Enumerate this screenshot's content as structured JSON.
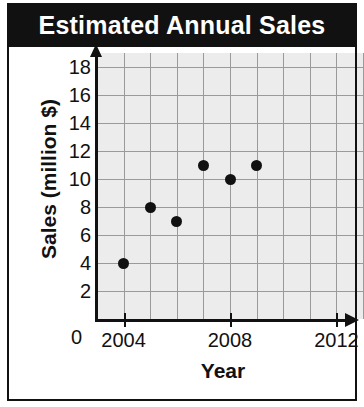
{
  "title": "Estimated Annual Sales",
  "colors": {
    "banner_background": "#111111",
    "banner_text": "#ffffff",
    "plot_background": "#ececec",
    "gridline": "#9a9a9a",
    "axis": "#111111",
    "marker": "#111111",
    "page_background": "#ffffff"
  },
  "axes": {
    "x_title": "Year",
    "y_title": "Sales (million $)",
    "origin_label": "0",
    "x_ticks": [
      "2004",
      "2008",
      "2012"
    ],
    "y_ticks": [
      "18",
      "16",
      "14",
      "12",
      "10",
      "8",
      "6",
      "4",
      "2"
    ]
  },
  "chart_data": {
    "type": "scatter",
    "title": "Estimated Annual Sales",
    "xlabel": "Year",
    "ylabel": "Sales (million $)",
    "x": [
      2004,
      2005,
      2006,
      2007,
      2008,
      2009
    ],
    "values": [
      4,
      8,
      7,
      11,
      10,
      11
    ],
    "points": [
      {
        "x": 2004,
        "y": 4
      },
      {
        "x": 2005,
        "y": 8
      },
      {
        "x": 2006,
        "y": 7
      },
      {
        "x": 2007,
        "y": 11
      },
      {
        "x": 2008,
        "y": 10
      },
      {
        "x": 2009,
        "y": 11
      }
    ],
    "xlim": [
      2003,
      2013
    ],
    "ylim": [
      0,
      19
    ],
    "x_tick_values": [
      2004,
      2008,
      2012
    ],
    "y_tick_values": [
      2,
      4,
      6,
      8,
      10,
      12,
      14,
      16,
      18
    ],
    "x_gridline_step": 1,
    "y_gridline_step": 2,
    "grid": true,
    "legend": null
  }
}
